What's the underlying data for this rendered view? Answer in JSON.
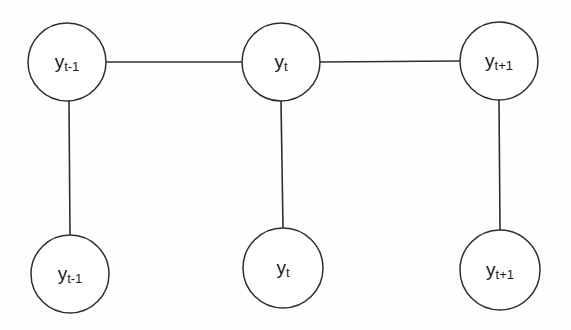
{
  "figure": {
    "type": "graphical-model-diagram",
    "title": "",
    "background_color": "#fefefe",
    "stroke_color": "#2e2e30",
    "label_color": "#1c1c1e",
    "node_fill": "#ffffff"
  },
  "nodes": [
    {
      "id": "hidden-t-minus-1",
      "row": "top",
      "base": "y",
      "subscript": "t-1",
      "label": "y t-1",
      "cx": 67,
      "cy": 62,
      "r": 39
    },
    {
      "id": "hidden-t",
      "row": "top",
      "base": "y",
      "subscript": "t",
      "label": "y t",
      "cx": 281,
      "cy": 62,
      "r": 39
    },
    {
      "id": "hidden-t-plus-1",
      "row": "top",
      "base": "y",
      "subscript": "t+1",
      "label": "y t+1",
      "cx": 499,
      "cy": 61,
      "r": 39
    },
    {
      "id": "observed-t-minus-1",
      "row": "bottom",
      "base": "y",
      "subscript": "t-1",
      "label": "y t-1",
      "cx": 70,
      "cy": 274,
      "r": 39
    },
    {
      "id": "observed-t",
      "row": "bottom",
      "base": "y",
      "subscript": "t",
      "label": "y t",
      "cx": 283,
      "cy": 268,
      "r": 40
    },
    {
      "id": "observed-t-plus-1",
      "row": "bottom",
      "base": "y",
      "subscript": "t+1",
      "label": "y t+1",
      "cx": 500,
      "cy": 270,
      "r": 40
    }
  ],
  "edges": [
    {
      "id": "edge-top-left-to-top-middle",
      "orientation": "horizontal",
      "x1": 106,
      "y1": 62,
      "x2": 242,
      "y2": 62
    },
    {
      "id": "edge-top-middle-to-top-right",
      "orientation": "horizontal",
      "x1": 320,
      "y1": 62,
      "x2": 460,
      "y2": 61
    },
    {
      "id": "edge-top-left-to-bottom-left",
      "orientation": "vertical",
      "x1": 69,
      "y1": 101,
      "x2": 70,
      "y2": 235
    },
    {
      "id": "edge-top-middle-to-bottom-middle",
      "orientation": "vertical",
      "x1": 281,
      "y1": 101,
      "x2": 283,
      "y2": 228
    },
    {
      "id": "edge-top-right-to-bottom-right",
      "orientation": "vertical",
      "x1": 499,
      "y1": 100,
      "x2": 500,
      "y2": 230
    }
  ]
}
